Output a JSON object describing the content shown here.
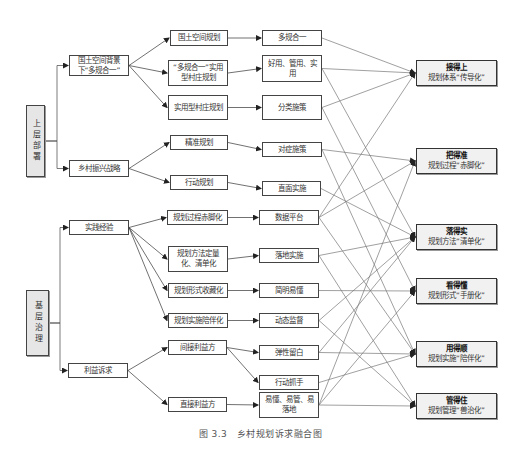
{
  "figure": {
    "caption": "图 3.3　乡村规划诉求融合图"
  },
  "roots": [
    {
      "id": "r1",
      "label": "上层部署"
    },
    {
      "id": "r2",
      "label": "基层治理"
    }
  ],
  "level1": [
    {
      "id": "a1",
      "label": "国土空间背景下“多规合一”"
    },
    {
      "id": "a2",
      "label": "乡村振兴战略"
    },
    {
      "id": "a3",
      "label": "实践经验"
    },
    {
      "id": "a4",
      "label": "利益诉求"
    }
  ],
  "level2": [
    {
      "id": "b1",
      "label": "国土空间规划"
    },
    {
      "id": "b2",
      "label": "“多规合一”实用型村庄规划"
    },
    {
      "id": "b3",
      "label": "实用型村庄规划"
    },
    {
      "id": "b4",
      "label": "精准规划"
    },
    {
      "id": "b5",
      "label": "行动规划"
    },
    {
      "id": "b6",
      "label": "规划过程赤脚化"
    },
    {
      "id": "b7",
      "label": "规划方法定量化、清单化"
    },
    {
      "id": "b8",
      "label": "规划形式收藏化"
    },
    {
      "id": "b9",
      "label": "规划实施陪伴化"
    },
    {
      "id": "b10",
      "label": "间接利益方"
    },
    {
      "id": "b11",
      "label": "直接利益方"
    }
  ],
  "level3": [
    {
      "id": "c1",
      "label": "多规合一"
    },
    {
      "id": "c2",
      "label": "好用、管用、实用"
    },
    {
      "id": "c3",
      "label": "分类施策"
    },
    {
      "id": "c4",
      "label": "对症施策"
    },
    {
      "id": "c5",
      "label": "直面实施"
    },
    {
      "id": "c6",
      "label": "数据平台"
    },
    {
      "id": "c7",
      "label": "落地实施"
    },
    {
      "id": "c8",
      "label": "简明易懂"
    },
    {
      "id": "c9",
      "label": "动态监督"
    },
    {
      "id": "c10",
      "label": "弹性留白"
    },
    {
      "id": "c11",
      "label": "行动抓手"
    },
    {
      "id": "c12",
      "label": "易懂、易管、易落地"
    }
  ],
  "outcomes": [
    {
      "id": "o1",
      "title": "接得上",
      "subtitle": "规划体系“传导化”"
    },
    {
      "id": "o2",
      "title": "把得准",
      "subtitle": "规划过程“赤脚化”"
    },
    {
      "id": "o3",
      "title": "落得实",
      "subtitle": "规划方法“清单化”"
    },
    {
      "id": "o4",
      "title": "看得懂",
      "subtitle": "规划形式“手册化”"
    },
    {
      "id": "o5",
      "title": "用得顺",
      "subtitle": "规划实施“陪伴化”"
    },
    {
      "id": "o6",
      "title": "管得住",
      "subtitle": "规划管理“兽治化”"
    }
  ],
  "edges": [
    [
      "r1",
      "a1"
    ],
    [
      "r1",
      "a2"
    ],
    [
      "r2",
      "a3"
    ],
    [
      "r2",
      "a4"
    ],
    [
      "a1",
      "b1"
    ],
    [
      "a1",
      "b2"
    ],
    [
      "a1",
      "b3"
    ],
    [
      "a2",
      "b4"
    ],
    [
      "a2",
      "b5"
    ],
    [
      "a3",
      "b6"
    ],
    [
      "a3",
      "b7"
    ],
    [
      "a3",
      "b8"
    ],
    [
      "a3",
      "b9"
    ],
    [
      "a4",
      "b10"
    ],
    [
      "a4",
      "b11"
    ],
    [
      "b1",
      "c1"
    ],
    [
      "b2",
      "c2"
    ],
    [
      "b3",
      "c3"
    ],
    [
      "b4",
      "c4"
    ],
    [
      "b5",
      "c5"
    ],
    [
      "b6",
      "c6"
    ],
    [
      "b7",
      "c7"
    ],
    [
      "b8",
      "c8"
    ],
    [
      "b9",
      "c9"
    ],
    [
      "b10",
      "c10"
    ],
    [
      "b10",
      "c11"
    ],
    [
      "b11",
      "c12"
    ],
    [
      "c1",
      "o1"
    ],
    [
      "c2",
      "o1"
    ],
    [
      "c3",
      "o1"
    ],
    [
      "c6",
      "o1"
    ],
    [
      "c2",
      "o3"
    ],
    [
      "c3",
      "o4"
    ],
    [
      "c4",
      "o2"
    ],
    [
      "c4",
      "o5"
    ],
    [
      "c5",
      "o3"
    ],
    [
      "c6",
      "o2"
    ],
    [
      "c6",
      "o5"
    ],
    [
      "c7",
      "o3"
    ],
    [
      "c7",
      "o6"
    ],
    [
      "c8",
      "o4"
    ],
    [
      "c9",
      "o3"
    ],
    [
      "c9",
      "o6"
    ],
    [
      "c10",
      "o3"
    ],
    [
      "c10",
      "o5"
    ],
    [
      "c11",
      "o5"
    ],
    [
      "c12",
      "o2"
    ],
    [
      "c12",
      "o4"
    ],
    [
      "c12",
      "o6"
    ]
  ]
}
